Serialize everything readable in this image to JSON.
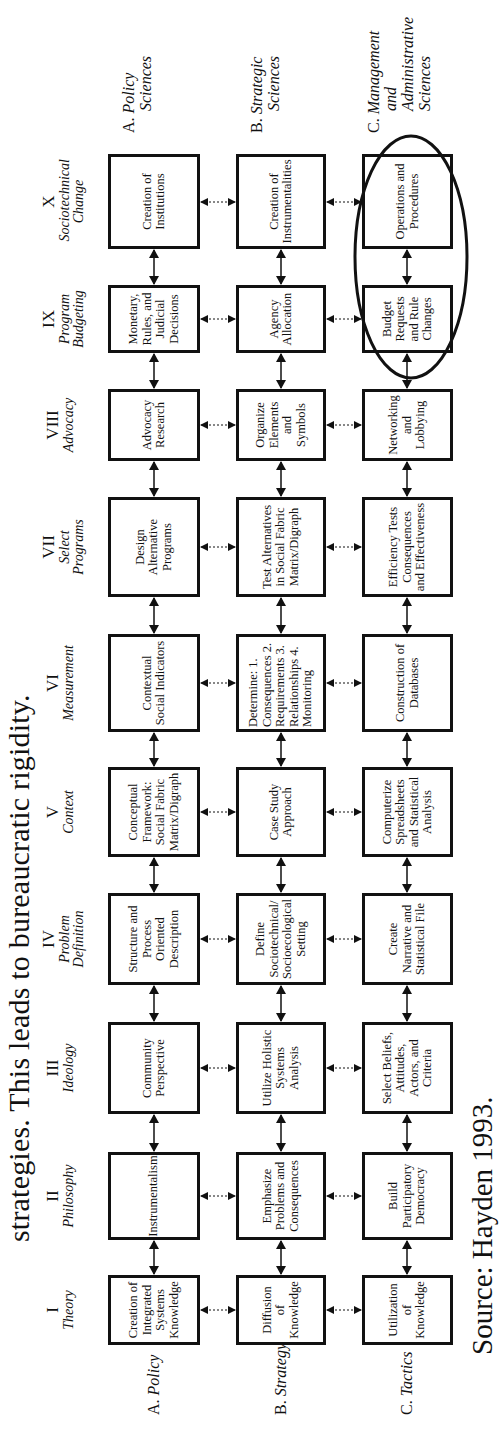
{
  "header_text": "strategies.  This leads to bureaucratic rigidity.",
  "source_text": "Source:  Hayden 1993.",
  "stages": [
    {
      "num": "I",
      "name": "Theory"
    },
    {
      "num": "II",
      "name": "Philosophy"
    },
    {
      "num": "III",
      "name": "Ideology"
    },
    {
      "num": "IV",
      "name": "Problem Definition"
    },
    {
      "num": "V",
      "name": "Context"
    },
    {
      "num": "VI",
      "name": "Measurement"
    },
    {
      "num": "VII",
      "name": "Select Programs"
    },
    {
      "num": "VIII",
      "name": "Advocacy"
    },
    {
      "num": "IX",
      "name": "Program Budgeting"
    },
    {
      "num": "X",
      "name": "Sociotechnical Change"
    }
  ],
  "rows": [
    {
      "prefix": "A.",
      "label": "Policy",
      "sciences_prefix": "C.",
      "sciences": "Policy Sciences",
      "cells": [
        "Creation of Integrated Systems Knowledge",
        "Instrumentalism",
        "Community Perspective",
        "Structure and Process Oriented Description",
        "Conceptual Framework: Social Fabric Matrix/Digraph",
        "Contextual Social Indicators",
        "Design Alternative Programs",
        "Advocacy Research",
        "Monetary, Rules, and Judicial Decisions",
        "Creation of Institutions"
      ]
    },
    {
      "prefix": "B.",
      "label": "Strategy",
      "sciences": "Strategic Sciences",
      "cells": [
        "Diffusion of Knowledge",
        "Emphasize Problems and Consequences",
        "Utilize Holistic Systems Analysis",
        "Define Sociotechnical/ Socioecological Setting",
        "Case Study Approach",
        "Determine: 1. Consequences 2. Requirements 3. Relationships 4. Monitoring",
        "Test Alternatives in Social Fabric Matrix/Digraph",
        "Organize Elements and Symbols",
        "Agency Allocation",
        "Creation of Instrumentalities"
      ]
    },
    {
      "prefix": "C.",
      "label": "Tactics",
      "sciences": "Management and Administrative Sciences",
      "cells": [
        "Utilization of Knowledge",
        "Build Participatory Democracy",
        "Select Beliefs, Attitudes, Actors, and Criteria",
        "Create Narrative and Statistical File",
        "Computerize Spreadsheets and Statistical Analysis",
        "Construction of Databases",
        "Efficiency Tests Consequences and Effectiveness",
        "Networking and Lobbying",
        "Budget Requests and Rule Changes",
        "Operations and Procedures"
      ]
    }
  ],
  "sciences_labels": {
    "a_prefix": "A.",
    "a_line1": "Policy",
    "a_line2": "Sciences",
    "b_prefix": "B.",
    "b_line1": "Strategic",
    "b_line2": "Sciences",
    "c_prefix": "C.",
    "c_line1": "Management",
    "c_line2": "and",
    "c_line3": "Administrative",
    "c_line4": "Sciences"
  },
  "highlight": {
    "note": "ellipse around C-row stages IX and X",
    "stroke": "#111111"
  }
}
